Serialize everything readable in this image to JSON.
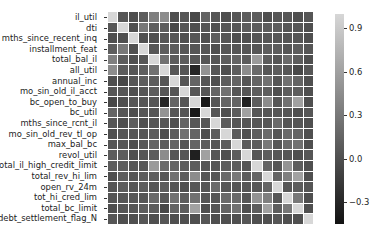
{
  "chart_data": {
    "type": "heatmap",
    "title": "",
    "xlabel": "",
    "ylabel": "",
    "labels": [
      "il_util",
      "dti",
      "mths_since_recent_inq",
      "installment_feat",
      "total_bal_il",
      "all_util",
      "annual_inc",
      "mo_sin_old_il_acct",
      "bc_open_to_buy",
      "bc_util",
      "mths_since_rcnt_il",
      "mo_sin_old_rev_tl_op",
      "max_bal_bc",
      "revol_util",
      "total_il_high_credit_limit",
      "total_rev_hi_lim",
      "open_rv_24m",
      "tot_hi_cred_lim",
      "total_bc_limit",
      "debt_settlement_flag_N"
    ],
    "colorbar": {
      "ticks": [
        0.9,
        0.6,
        0.3,
        0.0,
        -0.3
      ],
      "tick_labels": [
        "0.9",
        "0.6",
        "0.3",
        "0.0",
        "−0.3"
      ],
      "vmin": -0.45,
      "vmax": 1.0,
      "colormap": "gray"
    },
    "values": [
      [
        1.0,
        0.05,
        0.0,
        0.1,
        0.35,
        0.45,
        0.0,
        0.05,
        -0.05,
        0.15,
        0.05,
        0.0,
        0.05,
        0.1,
        0.1,
        0.0,
        0.05,
        0.05,
        0.0,
        0.05
      ],
      [
        0.05,
        1.0,
        0.0,
        0.3,
        0.1,
        0.1,
        -0.05,
        0.05,
        0.0,
        0.05,
        0.0,
        0.05,
        0.05,
        0.1,
        0.1,
        0.1,
        0.1,
        0.05,
        0.05,
        0.0
      ],
      [
        0.0,
        0.0,
        1.0,
        0.0,
        0.0,
        0.05,
        0.05,
        0.0,
        0.05,
        0.0,
        0.1,
        0.05,
        0.0,
        0.0,
        0.05,
        0.05,
        0.05,
        0.05,
        0.05,
        0.0
      ],
      [
        0.1,
        0.3,
        0.0,
        1.0,
        0.05,
        0.1,
        0.1,
        0.05,
        0.05,
        0.05,
        0.0,
        0.05,
        0.05,
        0.05,
        0.05,
        0.1,
        0.1,
        0.05,
        0.1,
        0.05
      ],
      [
        0.35,
        0.1,
        0.0,
        0.05,
        1.0,
        0.25,
        0.1,
        0.1,
        0.05,
        0.05,
        0.05,
        0.1,
        0.15,
        0.1,
        0.55,
        0.1,
        0.05,
        0.2,
        0.1,
        0.0
      ],
      [
        0.45,
        0.1,
        0.05,
        0.1,
        0.25,
        1.0,
        0.05,
        0.05,
        -0.3,
        0.5,
        0.05,
        0.0,
        0.1,
        0.45,
        0.2,
        0.05,
        0.1,
        0.05,
        -0.05,
        0.05
      ],
      [
        0.0,
        -0.05,
        0.05,
        0.1,
        0.1,
        0.05,
        1.0,
        0.05,
        0.15,
        0.05,
        0.0,
        0.1,
        0.15,
        0.05,
        0.15,
        0.25,
        0.05,
        0.25,
        0.15,
        0.0
      ],
      [
        0.05,
        0.05,
        0.0,
        0.05,
        0.1,
        0.05,
        0.05,
        1.0,
        0.05,
        0.05,
        0.15,
        0.25,
        0.05,
        0.05,
        0.1,
        0.1,
        0.0,
        0.1,
        0.1,
        0.0
      ],
      [
        -0.05,
        0.0,
        0.05,
        0.05,
        0.05,
        -0.3,
        0.15,
        0.05,
        1.0,
        -0.4,
        0.05,
        0.15,
        0.15,
        -0.35,
        0.1,
        0.45,
        0.05,
        0.25,
        0.6,
        0.0
      ],
      [
        0.15,
        0.05,
        0.0,
        0.05,
        0.05,
        0.5,
        0.05,
        0.05,
        -0.4,
        1.0,
        0.05,
        0.0,
        0.1,
        0.6,
        0.05,
        0.05,
        0.05,
        0.05,
        0.0,
        0.05
      ],
      [
        0.05,
        0.0,
        0.1,
        0.0,
        0.05,
        0.05,
        0.0,
        0.15,
        0.05,
        0.05,
        1.0,
        0.1,
        0.05,
        0.05,
        0.05,
        0.05,
        0.2,
        0.05,
        0.05,
        0.0
      ],
      [
        0.0,
        0.05,
        0.05,
        0.05,
        0.1,
        0.0,
        0.1,
        0.25,
        0.15,
        0.0,
        0.1,
        1.0,
        0.1,
        0.0,
        0.1,
        0.2,
        0.05,
        0.2,
        0.15,
        0.0
      ],
      [
        0.05,
        0.05,
        0.0,
        0.05,
        0.15,
        0.1,
        0.15,
        0.05,
        0.15,
        0.1,
        0.05,
        0.1,
        1.0,
        0.1,
        0.1,
        0.3,
        0.05,
        0.2,
        0.25,
        0.0
      ],
      [
        0.1,
        0.1,
        0.0,
        0.05,
        0.1,
        0.45,
        0.05,
        0.05,
        -0.35,
        0.6,
        0.05,
        0.0,
        0.1,
        1.0,
        0.05,
        0.1,
        0.05,
        0.05,
        0.0,
        0.05
      ],
      [
        0.1,
        0.1,
        0.05,
        0.05,
        0.55,
        0.2,
        0.15,
        0.1,
        0.1,
        0.05,
        0.05,
        0.1,
        0.1,
        0.05,
        1.0,
        0.15,
        0.05,
        0.5,
        0.1,
        0.0
      ],
      [
        0.0,
        0.1,
        0.05,
        0.1,
        0.1,
        0.05,
        0.25,
        0.1,
        0.45,
        0.05,
        0.05,
        0.2,
        0.3,
        0.1,
        0.15,
        1.0,
        0.15,
        0.35,
        0.6,
        0.0
      ],
      [
        0.05,
        0.1,
        0.05,
        0.1,
        0.05,
        0.1,
        0.05,
        0.0,
        0.05,
        0.05,
        0.2,
        0.05,
        0.05,
        0.05,
        0.05,
        0.15,
        1.0,
        0.05,
        0.1,
        0.05
      ],
      [
        0.05,
        0.05,
        0.05,
        0.05,
        0.2,
        0.05,
        0.25,
        0.1,
        0.25,
        0.05,
        0.05,
        0.2,
        0.2,
        0.05,
        0.5,
        0.35,
        0.05,
        1.0,
        0.3,
        0.0
      ],
      [
        0.0,
        0.05,
        0.05,
        0.1,
        0.1,
        -0.05,
        0.15,
        0.1,
        0.6,
        0.0,
        0.05,
        0.15,
        0.25,
        0.0,
        0.1,
        0.6,
        0.1,
        0.3,
        1.0,
        0.0
      ],
      [
        0.05,
        0.0,
        0.0,
        0.05,
        0.0,
        0.05,
        0.0,
        0.0,
        0.0,
        0.05,
        0.0,
        0.0,
        0.0,
        0.05,
        0.0,
        0.0,
        0.05,
        0.0,
        0.0,
        1.0
      ]
    ]
  }
}
